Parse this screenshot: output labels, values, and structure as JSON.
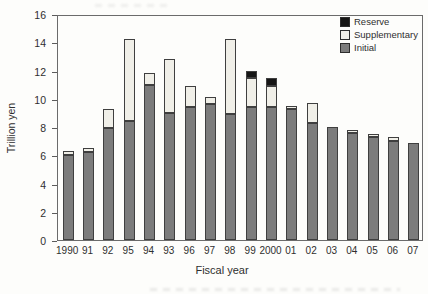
{
  "figure": {
    "y_axis_title": "Trillion yen",
    "x_axis_title": "Fiscal year"
  },
  "legend": [
    {
      "label": "Reserve",
      "color": "#161616"
    },
    {
      "label": "Supplementary",
      "color": "#f0efe8"
    },
    {
      "label": "Initial",
      "color": "#7c7c7c"
    }
  ],
  "chart_data": {
    "type": "bar",
    "stacked": true,
    "title": "",
    "xlabel": "Fiscal year",
    "ylabel": "Trillion yen",
    "ylim": [
      0,
      16
    ],
    "yticks": [
      0,
      2,
      4,
      6,
      8,
      10,
      12,
      14,
      16
    ],
    "grid": false,
    "legend_position": "top-right",
    "categories": [
      "1990",
      "91",
      "92",
      "95",
      "94",
      "93",
      "96",
      "97",
      "98",
      "99",
      "2000",
      "01",
      "02",
      "03",
      "04",
      "05",
      "06",
      "07"
    ],
    "series": [
      {
        "name": "Initial",
        "color": "#7c7c7c",
        "values": [
          6.0,
          6.2,
          7.9,
          8.4,
          11.0,
          9.0,
          9.4,
          9.6,
          8.9,
          9.4,
          9.4,
          9.3,
          8.3,
          8.0,
          7.6,
          7.3,
          7.0,
          6.9
        ]
      },
      {
        "name": "Supplementary",
        "color": "#f0efe8",
        "values": [
          0.3,
          0.3,
          1.4,
          5.8,
          0.8,
          3.8,
          1.5,
          0.5,
          5.3,
          2.1,
          1.5,
          0.2,
          1.4,
          0,
          0.2,
          0.2,
          0.3,
          0
        ]
      },
      {
        "name": "Reserve",
        "color": "#161616",
        "values": [
          0,
          0,
          0,
          0,
          0,
          0,
          0,
          0,
          0,
          0.5,
          0.6,
          0,
          0,
          0,
          0,
          0,
          0,
          0
        ]
      }
    ],
    "totals": [
      6.3,
      6.5,
      9.3,
      14.2,
      11.8,
      12.8,
      10.9,
      10.1,
      14.2,
      12.0,
      11.5,
      9.5,
      9.7,
      8.0,
      7.8,
      7.5,
      7.3,
      6.9
    ]
  }
}
